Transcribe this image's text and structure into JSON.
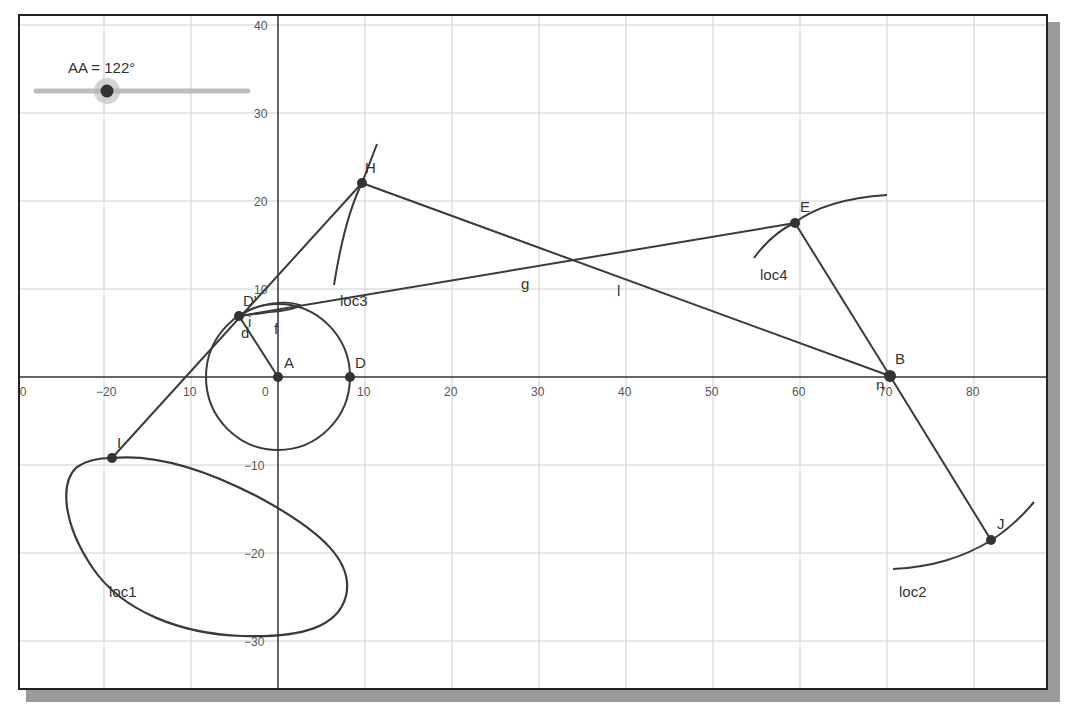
{
  "slider": {
    "label": "AA = 122°",
    "name": "AA",
    "value_deg": 122,
    "track": {
      "x1": 32,
      "x2": 246,
      "y": 89
    },
    "knob": {
      "x": 105,
      "y": 89
    }
  },
  "axes": {
    "origin_px": {
      "x": 276,
      "y": 375
    },
    "scale_px_per_unit": {
      "x": 8.7,
      "y": 8.8
    },
    "x_ticks": [
      {
        "label": "-30",
        "value": -30
      },
      {
        "label": "−20",
        "value": -20
      },
      {
        "label": "10",
        "value": -10
      },
      {
        "label": "0",
        "value": 0
      },
      {
        "label": "10",
        "value": 10
      },
      {
        "label": "20",
        "value": 20
      },
      {
        "label": "30",
        "value": 30
      },
      {
        "label": "40",
        "value": 40
      },
      {
        "label": "50",
        "value": 50
      },
      {
        "label": "60",
        "value": 60
      },
      {
        "label": "70",
        "value": 70
      },
      {
        "label": "80",
        "value": 80
      }
    ],
    "y_ticks": [
      {
        "label": "40",
        "value": 40
      },
      {
        "label": "30",
        "value": 30
      },
      {
        "label": "20",
        "value": 20
      },
      {
        "label": "10",
        "value": 10
      },
      {
        "label": "−10",
        "value": -10
      },
      {
        "label": "−20",
        "value": -20
      },
      {
        "label": "−30",
        "value": -30
      }
    ]
  },
  "points": [
    {
      "name": "A",
      "label": "A",
      "x": 0,
      "y": 0
    },
    {
      "name": "D",
      "label": "D",
      "x": 8.3,
      "y": 0
    },
    {
      "name": "D'",
      "label": "D'",
      "x": -4.5,
      "y": 7
    },
    {
      "name": "H",
      "label": "H",
      "x": 9.5,
      "y": 22
    },
    {
      "name": "E",
      "label": "E",
      "x": 59.5,
      "y": 17.5
    },
    {
      "name": "B",
      "label": "B",
      "x": 70.3,
      "y": 0
    },
    {
      "name": "J",
      "label": "J",
      "x": 82,
      "y": -18.5
    },
    {
      "name": "I",
      "label": "I",
      "x": -19,
      "y": -9
    }
  ],
  "segment_labels": [
    {
      "label": "d",
      "x": -3.5,
      "y": 4.5
    },
    {
      "label": "f",
      "x": -0.3,
      "y": 5.5
    },
    {
      "label": "g",
      "x": 28.5,
      "y": 10.5
    },
    {
      "label": "i",
      "x": -2.5,
      "y": 6
    },
    {
      "label": "l",
      "x": 39.5,
      "y": 9.5
    },
    {
      "label": "n",
      "x": 69.2,
      "y": -1.5
    }
  ],
  "loci": [
    {
      "label": "loc1",
      "label_x": -19,
      "label_y": -24.5
    },
    {
      "label": "loc2",
      "label_x": 71.5,
      "label_y": -24.5
    },
    {
      "label": "loc3",
      "label_x": 7,
      "label_y": 8.5
    },
    {
      "label": "loc4",
      "label_x": 55.5,
      "label_y": 11.5
    }
  ],
  "colors": {
    "line": "#3a3a3a",
    "grid": "#c8c8c8",
    "axis": "#333333",
    "point": "#333333",
    "slider_track": "#bdbdbd",
    "slider_halo": "#b0b0b0",
    "shadow": "#9a9a9a"
  }
}
